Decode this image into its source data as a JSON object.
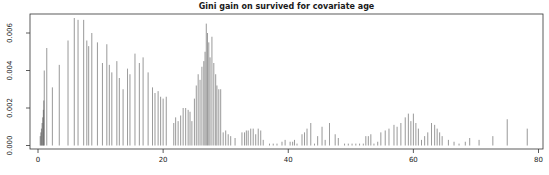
{
  "figure": {
    "background": "#ffffff",
    "spike_color": "#4a4a4a",
    "axis_color": "#333333",
    "text_color": "#1a1a1a"
  },
  "chart_data": {
    "type": "bar",
    "subtype": "spike-plot",
    "title": "Gini gain on survived for covariate age",
    "xlabel": "",
    "ylabel": "",
    "xlim": [
      0,
      80
    ],
    "ylim": [
      0,
      0.006
    ],
    "grid": false,
    "legend": "none",
    "x_ticks": [
      0,
      20,
      40,
      60,
      80
    ],
    "x_tick_labels": [
      "0",
      "20",
      "40",
      "60",
      "80"
    ],
    "y_ticks": [
      0,
      0.002,
      0.004,
      0.006
    ],
    "y_tick_labels": [
      "0.000",
      "0.002",
      "0.004",
      "0.006"
    ],
    "series": [
      {
        "name": "gini-gain-per-age-split",
        "points": [
          [
            0.35,
            0.0005
          ],
          [
            0.45,
            0.0007
          ],
          [
            0.55,
            0.0009
          ],
          [
            0.65,
            0.0012
          ],
          [
            0.75,
            0.0015
          ],
          [
            0.85,
            0.0019
          ],
          [
            0.92,
            0.0024
          ],
          [
            1.0,
            0.004
          ],
          [
            1.4,
            0.0052
          ],
          [
            2.3,
            0.0031
          ],
          [
            3.4,
            0.0043
          ],
          [
            4.8,
            0.0056
          ],
          [
            5.8,
            0.0068
          ],
          [
            6.4,
            0.0067
          ],
          [
            7.3,
            0.0067
          ],
          [
            7.8,
            0.0056
          ],
          [
            8.1,
            0.0053
          ],
          [
            8.6,
            0.006
          ],
          [
            9.5,
            0.0055
          ],
          [
            10.3,
            0.0044
          ],
          [
            11.0,
            0.0054
          ],
          [
            11.4,
            0.0043
          ],
          [
            11.8,
            0.0039
          ],
          [
            12.6,
            0.0045
          ],
          [
            13.0,
            0.0036
          ],
          [
            13.6,
            0.003
          ],
          [
            14.3,
            0.0041
          ],
          [
            14.7,
            0.0038
          ],
          [
            15.5,
            0.0049
          ],
          [
            16.2,
            0.0044
          ],
          [
            16.8,
            0.0047
          ],
          [
            17.6,
            0.0039
          ],
          [
            18.3,
            0.0031
          ],
          [
            18.7,
            0.0028
          ],
          [
            19.2,
            0.0029
          ],
          [
            19.6,
            0.0026
          ],
          [
            20.0,
            0.0025
          ],
          [
            20.5,
            0.0026
          ],
          [
            21.7,
            0.0012
          ],
          [
            22.0,
            0.0015
          ],
          [
            22.4,
            0.0013
          ],
          [
            22.8,
            0.0016
          ],
          [
            23.2,
            0.002
          ],
          [
            23.6,
            0.002
          ],
          [
            24.0,
            0.0019
          ],
          [
            24.3,
            0.0018
          ],
          [
            24.6,
            0.0013
          ],
          [
            25.0,
            0.0025
          ],
          [
            25.3,
            0.0032
          ],
          [
            25.6,
            0.0038
          ],
          [
            25.9,
            0.0035
          ],
          [
            26.2,
            0.0042
          ],
          [
            26.5,
            0.0045
          ],
          [
            26.7,
            0.005
          ],
          [
            26.9,
            0.0065
          ],
          [
            27.1,
            0.006
          ],
          [
            27.3,
            0.0055
          ],
          [
            27.5,
            0.0047
          ],
          [
            27.8,
            0.0058
          ],
          [
            28.1,
            0.0044
          ],
          [
            28.4,
            0.0038
          ],
          [
            28.6,
            0.0032
          ],
          [
            28.9,
            0.003
          ],
          [
            29.2,
            0.003
          ],
          [
            29.6,
            0.0007
          ],
          [
            30.0,
            0.0008
          ],
          [
            30.4,
            0.0006
          ],
          [
            30.8,
            0.0005
          ],
          [
            31.5,
            0.0004
          ],
          [
            32.6,
            0.0007
          ],
          [
            33.0,
            0.0007
          ],
          [
            33.3,
            0.0008
          ],
          [
            33.6,
            0.0008
          ],
          [
            34.0,
            0.0009
          ],
          [
            34.4,
            0.0009
          ],
          [
            34.8,
            0.0006
          ],
          [
            35.2,
            0.0009
          ],
          [
            35.6,
            0.0008
          ],
          [
            36.0,
            0.0003
          ],
          [
            37.0,
            0.0001
          ],
          [
            37.6,
            0.0001
          ],
          [
            38.2,
            0.0001
          ],
          [
            39.0,
            0.0002
          ],
          [
            39.5,
            0.0003
          ],
          [
            40.3,
            0.0002
          ],
          [
            40.7,
            0.0002
          ],
          [
            41.0,
            0.0003
          ],
          [
            41.4,
            0.0001
          ],
          [
            42.2,
            0.0006
          ],
          [
            42.6,
            0.0007
          ],
          [
            43.0,
            0.0009
          ],
          [
            43.6,
            0.0012
          ],
          [
            44.2,
            0.0001
          ],
          [
            44.7,
            0.0005
          ],
          [
            45.4,
            0.001
          ],
          [
            45.9,
            0.0003
          ],
          [
            46.6,
            0.0012
          ],
          [
            47.5,
            0.0006
          ],
          [
            48.0,
            0.0004
          ],
          [
            49.0,
            0.0001
          ],
          [
            49.6,
            0.0001
          ],
          [
            50.2,
            0.0001
          ],
          [
            50.8,
            0.0001
          ],
          [
            51.4,
            0.0001
          ],
          [
            52.0,
            0.0001
          ],
          [
            52.4,
            0.0005
          ],
          [
            52.8,
            0.0005
          ],
          [
            53.2,
            0.0006
          ],
          [
            53.7,
            0.0001
          ],
          [
            54.3,
            0.0002
          ],
          [
            54.8,
            0.0007
          ],
          [
            55.5,
            0.0008
          ],
          [
            56.1,
            0.0009
          ],
          [
            56.9,
            0.0011
          ],
          [
            57.4,
            0.001
          ],
          [
            58.0,
            0.0012
          ],
          [
            58.7,
            0.0015
          ],
          [
            59.2,
            0.0017
          ],
          [
            59.6,
            0.0013
          ],
          [
            60.0,
            0.0017
          ],
          [
            60.4,
            0.0012
          ],
          [
            60.8,
            0.0009
          ],
          [
            61.3,
            0.0003
          ],
          [
            61.8,
            0.0005
          ],
          [
            62.3,
            0.0007
          ],
          [
            62.9,
            0.0012
          ],
          [
            63.4,
            0.0011
          ],
          [
            63.8,
            0.0009
          ],
          [
            64.2,
            0.0007
          ],
          [
            64.6,
            0.0005
          ],
          [
            65.6,
            0.0003
          ],
          [
            66.5,
            0.0002
          ],
          [
            67.3,
            0.0001
          ],
          [
            68.3,
            0.0002
          ],
          [
            69.0,
            0.0004
          ],
          [
            70.5,
            0.0003
          ],
          [
            72.7,
            0.0005
          ],
          [
            75.0,
            0.0014
          ],
          [
            78.2,
            0.0009
          ]
        ]
      }
    ]
  }
}
